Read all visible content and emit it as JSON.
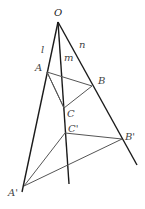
{
  "diagram": {
    "title": "",
    "points": {
      "O": {
        "label": "O",
        "x": 58,
        "y": 22
      },
      "A": {
        "label": "A",
        "x": 47,
        "y": 72
      },
      "B": {
        "label": "B",
        "x": 92,
        "y": 86
      },
      "C": {
        "label": "C",
        "x": 64,
        "y": 108
      },
      "C_prime": {
        "label": "C'",
        "x": 65,
        "y": 133
      },
      "B_prime": {
        "label": "B'",
        "x": 122,
        "y": 139
      },
      "A_prime": {
        "label": "A'",
        "x": 24,
        "y": 186
      }
    },
    "lines": {
      "l": {
        "label": "l"
      },
      "m": {
        "label": "m"
      },
      "n": {
        "label": "n"
      }
    },
    "colors": {
      "ray": "#1a1a1a",
      "triangle": "#555555",
      "label": "#444444"
    }
  }
}
